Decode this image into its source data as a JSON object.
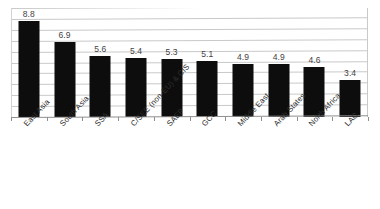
{
  "chart_data": {
    "type": "bar",
    "title": "",
    "subtitle": "",
    "xlabel": "",
    "ylabel": "",
    "categories": [
      "East Asia",
      "South Asia",
      "SSA",
      "C/SEE (non-EU) & CIS",
      "SAEP",
      "GCC",
      "Middle East",
      "Arab States",
      "North Africa",
      "LAC"
    ],
    "values": [
      8.8,
      6.9,
      5.6,
      5.4,
      5.3,
      5.1,
      4.9,
      4.9,
      4.6,
      3.4
    ],
    "data_labels": [
      "8.8",
      "6.9",
      "5.6",
      "5.4",
      "5.3",
      "5.1",
      "4.9",
      "4.9",
      "4.6",
      "3.4"
    ],
    "ylim": [
      0,
      10
    ],
    "grid": true,
    "gridline_count": 10,
    "ytick_labels_visible": false,
    "legend": false,
    "legend_position": "none",
    "bar_color": "#0d0d0d",
    "gridline_color": "#c9c9c9",
    "axis_color": "#8f8f8f",
    "label_color": "#3f3f3f",
    "category_label_color": "#2e2e2e",
    "background_color": "#ffffff",
    "category_label_rotation_deg": -47
  }
}
